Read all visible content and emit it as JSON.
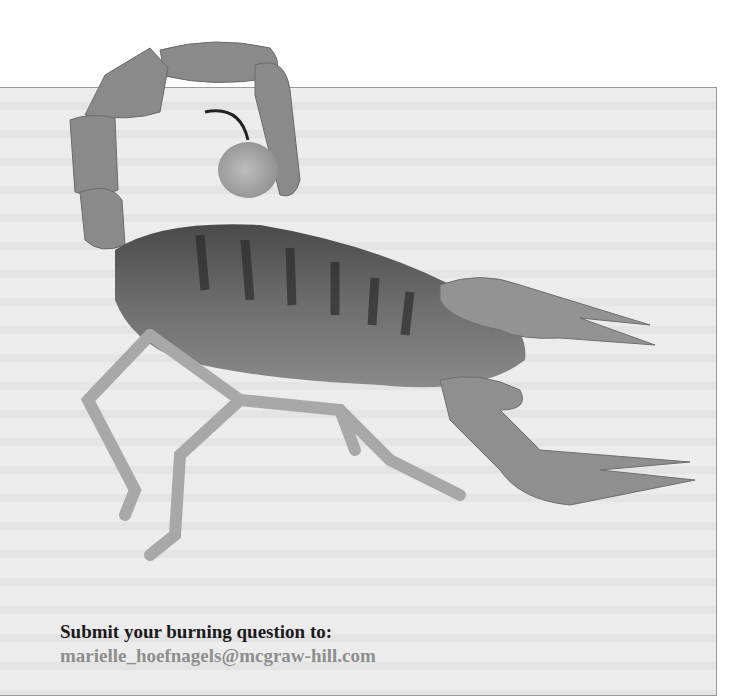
{
  "image": {
    "subject": "scorpion-photo",
    "style": "grayscale"
  },
  "callout": {
    "prompt": "Submit your burning question to:",
    "email": "marielle_hoefnagels@mcgraw-hill.com"
  },
  "colors": {
    "box_background": "#ececec",
    "box_border": "#9a9a9a",
    "prompt_text": "#1a1a1a",
    "email_text": "#8e8e8e"
  }
}
